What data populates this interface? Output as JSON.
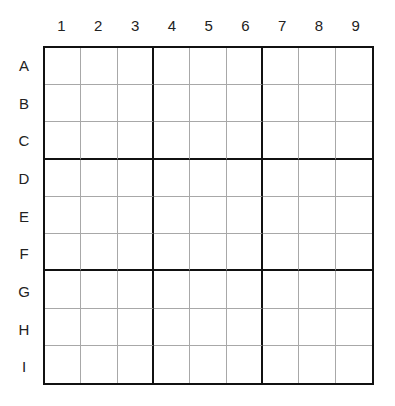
{
  "puzzle": {
    "type": "sudoku",
    "column_labels": [
      "1",
      "2",
      "3",
      "4",
      "5",
      "6",
      "7",
      "8",
      "9"
    ],
    "row_labels": [
      "A",
      "B",
      "C",
      "D",
      "E",
      "F",
      "G",
      "H",
      "I"
    ],
    "cells": [
      [
        "",
        "",
        "",
        "",
        "",
        "",
        "",
        "",
        ""
      ],
      [
        "",
        "",
        "",
        "",
        "",
        "",
        "",
        "",
        ""
      ],
      [
        "",
        "",
        "",
        "",
        "",
        "",
        "",
        "",
        ""
      ],
      [
        "",
        "",
        "",
        "",
        "",
        "",
        "",
        "",
        ""
      ],
      [
        "",
        "",
        "",
        "",
        "",
        "",
        "",
        "",
        ""
      ],
      [
        "",
        "",
        "",
        "",
        "",
        "",
        "",
        "",
        ""
      ],
      [
        "",
        "",
        "",
        "",
        "",
        "",
        "",
        "",
        ""
      ],
      [
        "",
        "",
        "",
        "",
        "",
        "",
        "",
        "",
        ""
      ],
      [
        "",
        "",
        "",
        "",
        "",
        "",
        "",
        "",
        ""
      ]
    ]
  },
  "colors": {
    "thick_line": "#111111",
    "thin_line": "#a8a8a8",
    "background": "#ffffff"
  }
}
